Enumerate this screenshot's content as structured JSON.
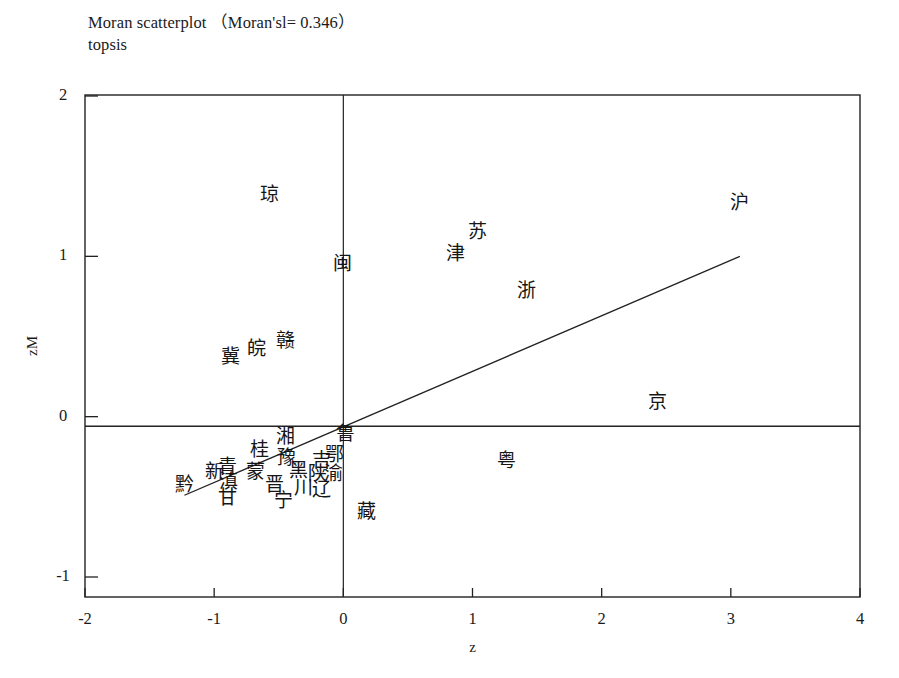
{
  "chart_data": {
    "type": "scatter",
    "title": "Moran scatterplot （Moran'sl= 0.346）",
    "subtitle": "topsis",
    "moran_i": 0.346,
    "xlabel": "z",
    "ylabel": "zM",
    "xlim": [
      -2,
      4
    ],
    "ylim": [
      -1.2,
      2.06
    ],
    "xticks": [
      "-2",
      "-1",
      "0",
      "1",
      "2",
      "3",
      "4"
    ],
    "xtick_values": [
      -2,
      -1,
      0,
      1,
      2,
      3,
      4
    ],
    "yticks": [
      "-1",
      "0",
      "1",
      "2"
    ],
    "ytick_values": [
      -1,
      0,
      1,
      2
    ],
    "grid": false,
    "legend": null,
    "reference_lines": {
      "vertical_x": 0,
      "horizontal_y": -0.06
    },
    "regression_line": {
      "x_start": -1.23,
      "y_start": -0.49,
      "x_end": 3.07,
      "y_end": 1.0,
      "slope": 0.346
    },
    "point_labels": true,
    "points": [
      {
        "label": "琼",
        "x": -0.57,
        "y": 1.39
      },
      {
        "label": "沪",
        "x": 3.07,
        "y": 1.34
      },
      {
        "label": "苏",
        "x": 1.04,
        "y": 1.16
      },
      {
        "label": "津",
        "x": 0.87,
        "y": 1.02
      },
      {
        "label": "闽",
        "x": -0.01,
        "y": 0.96
      },
      {
        "label": "浙",
        "x": 1.42,
        "y": 0.79
      },
      {
        "label": "赣",
        "x": -0.45,
        "y": 0.48
      },
      {
        "label": "皖",
        "x": -0.67,
        "y": 0.43
      },
      {
        "label": "冀",
        "x": -0.87,
        "y": 0.38
      },
      {
        "label": "京",
        "x": 2.43,
        "y": 0.1
      },
      {
        "label": "湘",
        "x": -0.45,
        "y": -0.12
      },
      {
        "label": "鲁",
        "x": 0.02,
        "y": -0.1
      },
      {
        "label": "桂",
        "x": -0.65,
        "y": -0.2
      },
      {
        "label": "豫",
        "x": -0.44,
        "y": -0.25
      },
      {
        "label": "鄂",
        "x": -0.07,
        "y": -0.23
      },
      {
        "label": "吉",
        "x": -0.17,
        "y": -0.27
      },
      {
        "label": "粤",
        "x": 1.26,
        "y": -0.27
      },
      {
        "label": "新",
        "x": -1.0,
        "y": -0.34
      },
      {
        "label": "青",
        "x": -0.9,
        "y": -0.31
      },
      {
        "label": "蒙",
        "x": -0.68,
        "y": -0.34
      },
      {
        "label": "黑",
        "x": -0.35,
        "y": -0.33
      },
      {
        "label": "陕",
        "x": -0.2,
        "y": -0.35
      },
      {
        "label": "渝",
        "x": -0.08,
        "y": -0.35
      },
      {
        "label": "黔",
        "x": -1.23,
        "y": -0.42
      },
      {
        "label": "滇",
        "x": -0.89,
        "y": -0.4
      },
      {
        "label": "晋",
        "x": -0.53,
        "y": -0.42
      },
      {
        "label": "川",
        "x": -0.31,
        "y": -0.44
      },
      {
        "label": "辽",
        "x": -0.17,
        "y": -0.45
      },
      {
        "label": "甘",
        "x": -0.9,
        "y": -0.5
      },
      {
        "label": "宁",
        "x": -0.46,
        "y": -0.52
      },
      {
        "label": "藏",
        "x": 0.18,
        "y": -0.59
      }
    ]
  },
  "axis": {
    "x_title": "z",
    "y_title": "zM"
  }
}
